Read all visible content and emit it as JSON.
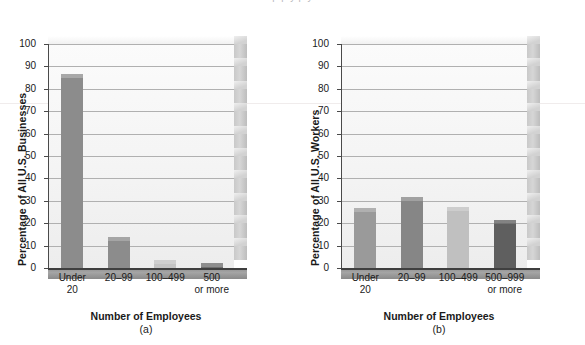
{
  "figure": {
    "clipped_caption": "p                                  p y                      p y",
    "panels": [
      {
        "id": "a",
        "sub_caption": "(a)",
        "ylabel": "Percentage of All U.S. Businesses",
        "xlabel": "Number of Employees"
      },
      {
        "id": "b",
        "sub_caption": "(b)",
        "ylabel": "Percentage of All U.S. Workers",
        "xlabel": "Number of Employees"
      }
    ]
  },
  "chart_data": [
    {
      "type": "bar",
      "title": "",
      "panel": "(a)",
      "xlabel": "Number of Employees",
      "ylabel": "Percentage of All U.S. Businesses",
      "categories": [
        "Under 20",
        "20–99",
        "100–499",
        "500 or more"
      ],
      "category_lines": [
        [
          "Under",
          "20"
        ],
        [
          "20–99",
          ""
        ],
        [
          "100–499",
          ""
        ],
        [
          "500",
          "or more"
        ]
      ],
      "values": [
        85,
        12,
        2,
        0.4
      ],
      "colors": [
        "#8c8c8c",
        "#8c8c8c",
        "#c4c4c4",
        "#6e6e6e"
      ],
      "ylim": [
        0,
        100
      ],
      "yticks": [
        0,
        10,
        20,
        30,
        40,
        50,
        60,
        70,
        80,
        90,
        100
      ],
      "grid": true,
      "legend": "none"
    },
    {
      "type": "bar",
      "title": "",
      "panel": "(b)",
      "xlabel": "Number of Employees",
      "ylabel": "Percentage of All U.S. Workers",
      "categories": [
        "Under 20",
        "20–99",
        "100–499",
        "500–999 or more"
      ],
      "category_lines": [
        [
          "Under",
          "20"
        ],
        [
          "20–99",
          ""
        ],
        [
          "100–499",
          ""
        ],
        [
          "500–999",
          "or more"
        ]
      ],
      "values": [
        25,
        30,
        25.5,
        19.5
      ],
      "colors": [
        "#9a9a9a",
        "#868686",
        "#c0c0c0",
        "#5f5f5f"
      ],
      "ylim": [
        0,
        100
      ],
      "yticks": [
        0,
        10,
        20,
        30,
        40,
        50,
        60,
        70,
        80,
        90,
        100
      ],
      "grid": true,
      "legend": "none"
    }
  ]
}
